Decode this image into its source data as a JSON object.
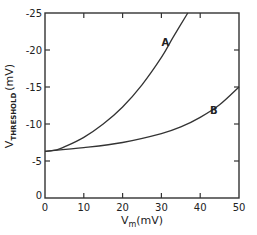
{
  "chart_data": {
    "type": "line",
    "title": "",
    "xlabel": "Vm (mV)",
    "xlabel_main": "V",
    "xlabel_sub": "m",
    "xlabel_unit": "(mV)",
    "ylabel": "VTHRESHOLD (mV)",
    "ylabel_main": "V",
    "ylabel_sub": "THRESHOLD",
    "ylabel_unit": "(mV)",
    "xlim": [
      0,
      50
    ],
    "ylim": [
      0,
      -25
    ],
    "xticks": [
      0,
      10,
      20,
      30,
      40,
      50
    ],
    "yticks": [
      0,
      -5,
      -10,
      -15,
      -20,
      -25
    ],
    "xtick_labels": [
      "0",
      "10",
      "20",
      "30",
      "40",
      "50"
    ],
    "ytick_labels": [
      "0",
      "-5",
      "-10",
      "-15",
      "-20",
      "-25"
    ],
    "grid": false,
    "legend": "none (curves labeled inline)",
    "series": [
      {
        "name": "A",
        "x": [
          0,
          3,
          5,
          10,
          15,
          20,
          25,
          30,
          33,
          36.8
        ],
        "values": [
          -6.3,
          -6.5,
          -6.9,
          -8.2,
          -10.0,
          -12.3,
          -15.3,
          -19.0,
          -21.7,
          -25.0
        ],
        "label_pos": [
          31,
          -20.5
        ]
      },
      {
        "name": "B",
        "x": [
          0,
          10,
          20,
          30,
          35,
          40,
          45,
          50
        ],
        "values": [
          -6.3,
          -6.8,
          -7.5,
          -8.7,
          -9.6,
          -10.9,
          -12.6,
          -15.0
        ],
        "label_pos": [
          43.5,
          -11.3
        ]
      }
    ],
    "color": "#333333"
  }
}
